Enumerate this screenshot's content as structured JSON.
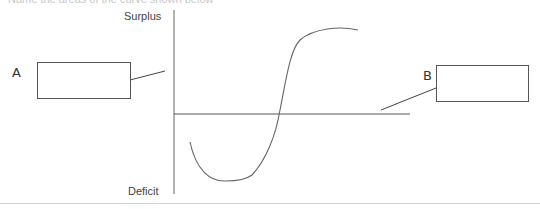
{
  "header": {
    "instruction_text": "Name the areas of the curve shown below"
  },
  "diagram": {
    "y_axis": {
      "top_label": "Surplus",
      "bottom_label": "Deficit"
    },
    "labels": {
      "a": "A",
      "b": "B"
    },
    "answer_boxes": {
      "a": "",
      "b": ""
    },
    "colors": {
      "line": "#555555",
      "curve": "#666666",
      "separator": "#d0d0d0"
    }
  }
}
